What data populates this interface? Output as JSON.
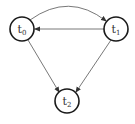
{
  "diagram": {
    "type": "state-graph",
    "colors": {
      "node_stroke": "#1a1a1a",
      "edge": "#555555",
      "label": "#333333"
    },
    "nodes": [
      {
        "id": "t0",
        "base": "t",
        "sub": "0",
        "cx": 22,
        "cy": 29,
        "r": 12
      },
      {
        "id": "t1",
        "base": "t",
        "sub": "1",
        "cx": 116,
        "cy": 29,
        "r": 12
      },
      {
        "id": "t2",
        "base": "t",
        "sub": "2",
        "cx": 67,
        "cy": 101,
        "r": 12
      }
    ],
    "edges": [
      {
        "from": "t0",
        "to": "t1",
        "style": "curved"
      },
      {
        "from": "t1",
        "to": "t0",
        "style": "straight"
      },
      {
        "from": "t0",
        "to": "t2",
        "style": "straight"
      },
      {
        "from": "t1",
        "to": "t2",
        "style": "straight"
      }
    ]
  }
}
